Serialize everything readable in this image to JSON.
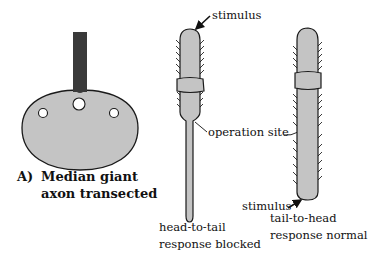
{
  "panel_a": {
    "label_letter": "A)",
    "label_line1": "Median giant",
    "label_line2": "axon transected"
  },
  "worm_left": {
    "stimulus_label": "stimulus",
    "caption_line1": "head-to-tail",
    "caption_line2": "response blocked"
  },
  "worm_right": {
    "stimulus_label": "stimulus",
    "caption_line1": "tail-to-head",
    "caption_line2": "response normal"
  },
  "shared": {
    "operation_site_label": "operation site"
  },
  "colors": {
    "body_fill": "#c4c4c4",
    "outline": "#1a1a1a",
    "probe": "#3a3a3a",
    "background": "#ffffff"
  }
}
